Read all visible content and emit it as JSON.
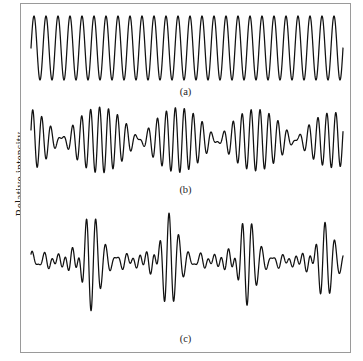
{
  "figure": {
    "y_axis_label": "Relative intensity",
    "background_color": "#ffffff",
    "frame_color": "#9a9a9a",
    "trace_color": "#111111"
  },
  "panels": [
    {
      "id": "a",
      "caption": "(a)"
    },
    {
      "id": "b",
      "caption": "(b)"
    },
    {
      "id": "c",
      "caption": "(c)"
    }
  ],
  "chart_data": {
    "type": "line",
    "title": "",
    "xlabel": "",
    "ylabel": "Relative intensity",
    "grid": false,
    "legend": "none",
    "series": [
      {
        "name": "(a)",
        "panel": "a",
        "kind": "monochromatic-sinusoid",
        "xlim": [
          0,
          1
        ],
        "ylim": [
          -1,
          1
        ],
        "cycles": 26,
        "amplitude": 1.0,
        "components": [
          {
            "frequency": 26.0,
            "amplitude": 1.0,
            "phase": 0.0
          }
        ]
      },
      {
        "name": "(b)",
        "panel": "b",
        "kind": "two-frequency-beat",
        "xlim": [
          0,
          1
        ],
        "ylim": [
          -1,
          1
        ],
        "cycles": 34,
        "beats": 4,
        "components": [
          {
            "frequency": 33.0,
            "amplitude": 1.0,
            "phase": 0.0
          },
          {
            "frequency": 37.0,
            "amplitude": 0.9,
            "phase": 0.7
          }
        ]
      },
      {
        "name": "(c)",
        "panel": "c",
        "kind": "many-frequency-superposition",
        "xlim": [
          0,
          1
        ],
        "ylim": [
          -1,
          1
        ],
        "cycles": 36,
        "components": [
          {
            "frequency": 30.0,
            "amplitude": 1.0,
            "phase": 0.0
          },
          {
            "frequency": 34.0,
            "amplitude": 0.85,
            "phase": 1.1
          },
          {
            "frequency": 38.0,
            "amplitude": 0.7,
            "phase": 2.4
          },
          {
            "frequency": 42.0,
            "amplitude": 0.55,
            "phase": 3.9
          },
          {
            "frequency": 26.0,
            "amplitude": 0.6,
            "phase": 5.1
          },
          {
            "frequency": 46.0,
            "amplitude": 0.35,
            "phase": 0.45
          },
          {
            "frequency": 22.0,
            "amplitude": 0.3,
            "phase": 2.8
          }
        ]
      }
    ]
  }
}
